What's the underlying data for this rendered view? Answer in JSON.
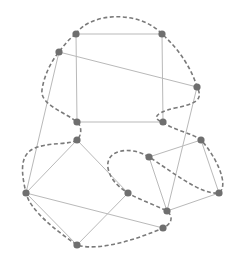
{
  "diagram": {
    "type": "graph-with-tour",
    "colors": {
      "background": "#ffffff",
      "edge": "#b9b9b9",
      "tour": "#7a7a7a",
      "node": "#6f6f6f"
    },
    "nodes": [
      {
        "id": "A"
      },
      {
        "id": "B"
      },
      {
        "id": "C"
      },
      {
        "id": "D"
      },
      {
        "id": "E"
      },
      {
        "id": "F"
      },
      {
        "id": "G"
      },
      {
        "id": "H"
      },
      {
        "id": "I"
      },
      {
        "id": "J"
      },
      {
        "id": "K"
      },
      {
        "id": "L"
      },
      {
        "id": "M"
      },
      {
        "id": "N"
      },
      {
        "id": "P"
      }
    ],
    "edges": [
      [
        "A",
        "B"
      ],
      [
        "A",
        "E"
      ],
      [
        "B",
        "F"
      ],
      [
        "E",
        "F"
      ],
      [
        "C",
        "D"
      ],
      [
        "C",
        "K"
      ],
      [
        "D",
        "M"
      ],
      [
        "G",
        "K"
      ],
      [
        "G",
        "J"
      ],
      [
        "K",
        "N"
      ],
      [
        "K",
        "L"
      ],
      [
        "J",
        "L"
      ],
      [
        "H",
        "I"
      ],
      [
        "H",
        "M"
      ],
      [
        "I",
        "P"
      ],
      [
        "P",
        "M"
      ]
    ],
    "tour": [
      "A",
      "B",
      "D",
      "F",
      "I",
      "P",
      "H",
      "J",
      "M",
      "N",
      "L",
      "K",
      "G",
      "E",
      "C",
      "A"
    ]
  }
}
